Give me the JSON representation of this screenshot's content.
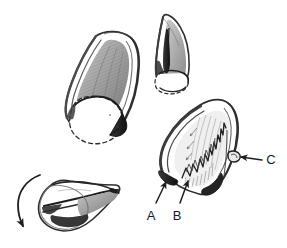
{
  "figure": {
    "type": "scientific-sketch",
    "medium": "pencil-ink-drawing",
    "background_color": "#ffffff",
    "ink_color": "#2b2b2b",
    "shade_color": "#8a8a8a",
    "light_shade_color": "#bdbdbd",
    "panel_count": 4
  },
  "panels": [
    {
      "id": "panel-top-left",
      "name": "large-three-quarter-view",
      "description": "Large cone-shaped shell seen in three-quarter view with shaded interior and dashed circular aperture rim at the base"
    },
    {
      "id": "panel-top-middle",
      "name": "narrow-profile-view",
      "description": "Narrow profile view of the shell with dark interior stripe and dashed aperture arc"
    },
    {
      "id": "panel-bottom-left",
      "name": "rotated-apex-view",
      "description": "Shell rotated showing tapering point, with a curved rotation arrow at the left"
    },
    {
      "id": "panel-bottom-right",
      "name": "labelled-detail-view",
      "description": "Shell detail view with serrated inner margin, hatching and callout labels A, B and C"
    }
  ],
  "labels": [
    {
      "id": "label-a",
      "text": "A",
      "x": 151,
      "y": 216,
      "target": "shell-anterior-tip"
    },
    {
      "id": "label-b",
      "text": "B",
      "x": 177,
      "y": 216,
      "target": "serrated-inner-margin"
    },
    {
      "id": "label-c",
      "text": "C",
      "x": 271,
      "y": 162,
      "target": "lateral-notch"
    }
  ],
  "arrows": [
    {
      "id": "arrow-a",
      "name": "callout-arrow-a",
      "direction": "up",
      "label": "A"
    },
    {
      "id": "arrow-b",
      "name": "callout-arrow-b",
      "direction": "up",
      "label": "B"
    },
    {
      "id": "arrow-c",
      "name": "callout-arrow-c",
      "direction": "left",
      "label": "C"
    },
    {
      "id": "arrow-rotation",
      "name": "rotation-arrow",
      "direction": "curved-down-left",
      "label": ""
    }
  ]
}
